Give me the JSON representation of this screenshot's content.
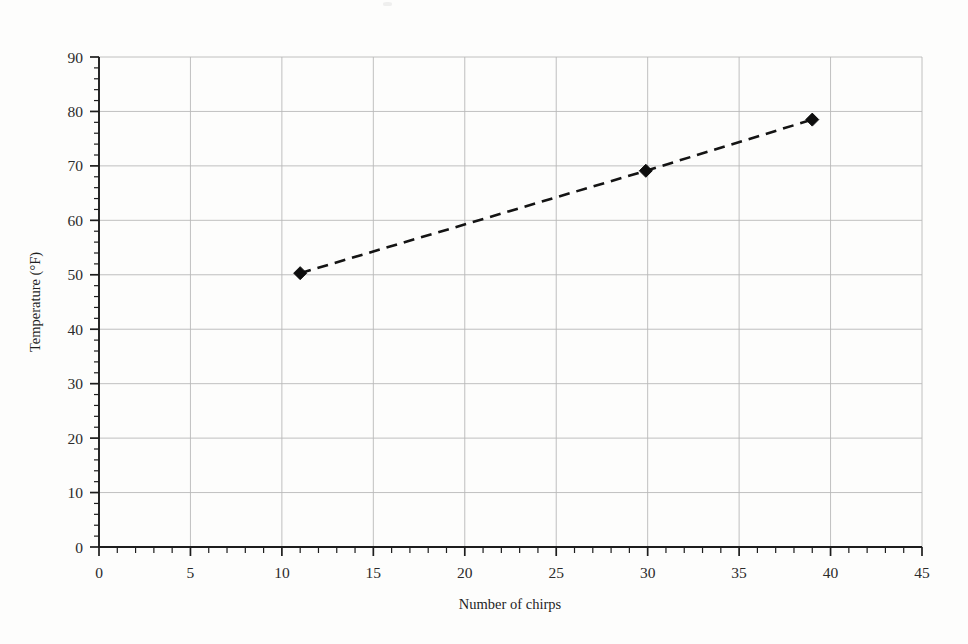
{
  "chart_data": {
    "type": "line",
    "title": "",
    "subtitle": "",
    "xlabel": "Number of chirps",
    "ylabel": "Temperature (°F)",
    "xlim": [
      0,
      45
    ],
    "ylim": [
      0,
      90
    ],
    "x_major_ticks": [
      0,
      5,
      10,
      15,
      20,
      25,
      30,
      35,
      40,
      45
    ],
    "y_major_ticks": [
      0,
      10,
      20,
      30,
      40,
      50,
      60,
      70,
      80,
      90
    ],
    "x_minor_step": 1,
    "y_minor_step": 2,
    "x_tick_labels": [
      "0",
      "5",
      "10",
      "15",
      "20",
      "25",
      "30",
      "35",
      "40",
      "45"
    ],
    "y_tick_labels": [
      "0",
      "10",
      "20",
      "30",
      "40",
      "50",
      "60",
      "70",
      "80",
      "90"
    ],
    "grid": true,
    "grid_color": "#b9b9b9",
    "legend": false,
    "legend_position": "none",
    "series": [
      {
        "name": "Temperature vs chirps",
        "color": "#141414",
        "line_style": "dashed",
        "marker": "diamond",
        "x": [
          11.0,
          29.9,
          39.0
        ],
        "values": [
          50.3,
          69.1,
          78.5
        ],
        "points": [
          {
            "x": 11.0,
            "y": 50.3
          },
          {
            "x": 29.9,
            "y": 69.1
          },
          {
            "x": 39.0,
            "y": 78.5
          }
        ]
      }
    ],
    "annotations": []
  },
  "figure": {
    "background_color": "#fdfdfc",
    "axis_color": "#1d1d1d",
    "text_color": "#1f1f1f"
  }
}
